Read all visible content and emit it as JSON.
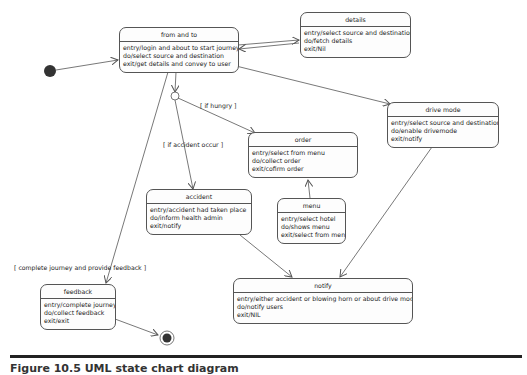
{
  "diagram": {
    "type": "UML state chart",
    "states": {
      "from_and_to": {
        "name": "from and to",
        "entry": "entry/login and about to start journey",
        "do": "do/select source and destination",
        "exit": "exit/get details and convey to user"
      },
      "details": {
        "name": "details",
        "entry": "entry/select source and destination",
        "do": "do/fetch details",
        "exit": "exit/Nil"
      },
      "drive_mode": {
        "name": "drive mode",
        "entry": "entry/select source and destination",
        "do": "do/enable drivemode",
        "exit": "exit/notify"
      },
      "order": {
        "name": "order",
        "entry": "entry/select from menu",
        "do": "do/collect order",
        "exit": "exit/cofirm order"
      },
      "accident": {
        "name": "accident",
        "entry": "entry/accident had taken place",
        "do": "do/inform health admin",
        "exit": "exit/notify"
      },
      "menu": {
        "name": "menu",
        "entry": "entry/select hotel",
        "do": "do/shows menu",
        "exit": "exit/select from menu"
      },
      "notify": {
        "name": "notify",
        "entry": "entry/either accident or blowing horn or about drive mode",
        "do": "do/notify users",
        "exit": "exit/NIL"
      },
      "feedback": {
        "name": "feedback",
        "entry": "entry/complete journey",
        "do": "do/collect feedback",
        "exit": "exit/exit"
      }
    },
    "guards": {
      "hungry": "[ if hungry ]",
      "accident": "[ if accident occur ]",
      "complete": "[ complete journey and provide feedback ]"
    },
    "colors": {
      "line": "#555555",
      "state_border": "#555555",
      "initial_fill": "#333333"
    }
  },
  "caption": "Figure 10.5   UML state chart diagram"
}
